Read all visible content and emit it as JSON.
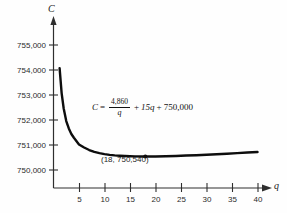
{
  "chart_data": {
    "type": "line",
    "title": "",
    "subtitle": "",
    "xlabel": "q",
    "ylabel": "C",
    "xlim": [
      0,
      43
    ],
    "ylim": [
      749600,
      755600
    ],
    "grid": false,
    "legend": "none",
    "equation_text": "C = 4,860/q + 15q + 750,000",
    "equation_parts": {
      "lhs": "C",
      "equals": "=",
      "numerator": "4,860",
      "denominator": "q",
      "plus_one": "+",
      "linear_term": "15q",
      "plus_two": "+",
      "constant": "750,000"
    },
    "x_ticks": [
      5,
      10,
      15,
      20,
      25,
      30,
      35,
      40
    ],
    "x_tick_labels": [
      "5",
      "10",
      "15",
      "20",
      "25",
      "30",
      "35",
      "40"
    ],
    "y_ticks": [
      750000,
      751000,
      752000,
      753000,
      754000,
      755000
    ],
    "y_tick_labels": [
      "750,000",
      "751,000",
      "752,000",
      "753,000",
      "754,000",
      "755,000"
    ],
    "annotations": [
      {
        "name": "minimum-point",
        "label": "(18, 750,540)",
        "x": 18,
        "y": 750540,
        "marker": "dot"
      }
    ],
    "series": [
      {
        "name": "total-cost-curve",
        "color": "#0d0d0d",
        "line_width": 2.4,
        "x": [
          1.2,
          1.6,
          2,
          2.5,
          3,
          3.5,
          4,
          5,
          6,
          7,
          8,
          9,
          10,
          11,
          12,
          13,
          14,
          15,
          16,
          17,
          18,
          19,
          20,
          22,
          24,
          26,
          28,
          30,
          32,
          34,
          36,
          38,
          40
        ],
        "y": [
          754068,
          753067,
          752460,
          751959,
          751665,
          751441,
          751290,
          751022,
          750900,
          750799,
          750727,
          750675,
          750636,
          750607,
          750585,
          750569,
          750557,
          750549,
          750544,
          750541,
          750540,
          750541,
          750543,
          750551,
          750562,
          750577,
          750593,
          750612,
          750632,
          750653,
          750675,
          750698,
          750721
        ]
      }
    ]
  },
  "axes": {
    "y_axis_label": "C",
    "x_axis_label": "q"
  }
}
